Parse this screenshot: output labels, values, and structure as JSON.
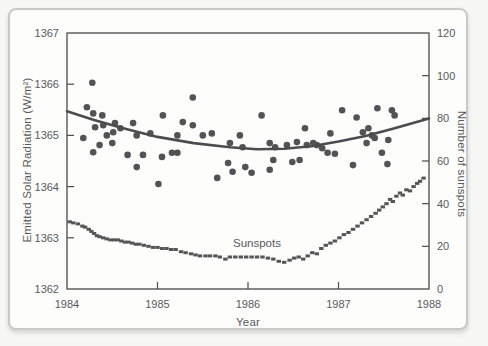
{
  "chart_data": {
    "type": "scatter",
    "title": "",
    "xlabel": "Year",
    "ylabel_left": "Emitted Solar Radiation (W/m²)",
    "ylabel_right": "Number of sunspots",
    "xlim": [
      1984,
      1988
    ],
    "ylim_left": [
      1362,
      1367
    ],
    "ylim_right": [
      0,
      120
    ],
    "x_ticks": [
      1984,
      1985,
      1986,
      1987,
      1988
    ],
    "y_left_ticks": [
      1362,
      1363,
      1364,
      1365,
      1366,
      1367
    ],
    "y_right_ticks": [
      0,
      20,
      40,
      60,
      80,
      100,
      120
    ],
    "grid": false,
    "legend": "none",
    "annotation": {
      "text": "Sunspots",
      "x": 1986.05,
      "y_right": 20
    },
    "style": {
      "axis_color": "#4b4b4b",
      "text_color": "#59595b",
      "point_color": "#535355",
      "curve_color": "#4c4c4e",
      "sunspot_color": "#565658",
      "card_border": "#c9c9c7",
      "card_bg": "#fdfdfc"
    },
    "series": [
      {
        "name": "emitted-solar-radiation",
        "type": "scatter",
        "marker": "circle",
        "axis": "left",
        "points": [
          [
            1984.18,
            1364.95
          ],
          [
            1984.22,
            1365.55
          ],
          [
            1984.28,
            1366.03
          ],
          [
            1984.29,
            1365.43
          ],
          [
            1984.29,
            1364.67
          ],
          [
            1984.31,
            1365.16
          ],
          [
            1984.36,
            1364.81
          ],
          [
            1984.39,
            1365.39
          ],
          [
            1984.4,
            1365.2
          ],
          [
            1984.44,
            1365.0
          ],
          [
            1984.5,
            1364.85
          ],
          [
            1984.51,
            1365.06
          ],
          [
            1984.53,
            1365.24
          ],
          [
            1984.59,
            1365.14
          ],
          [
            1984.67,
            1364.62
          ],
          [
            1984.73,
            1365.24
          ],
          [
            1984.77,
            1365.0
          ],
          [
            1984.77,
            1364.38
          ],
          [
            1984.84,
            1364.62
          ],
          [
            1984.92,
            1365.04
          ],
          [
            1985.01,
            1364.05
          ],
          [
            1985.05,
            1364.58
          ],
          [
            1985.06,
            1365.39
          ],
          [
            1985.16,
            1364.66
          ],
          [
            1985.22,
            1365.0
          ],
          [
            1985.22,
            1364.66
          ],
          [
            1985.28,
            1365.26
          ],
          [
            1985.39,
            1365.74
          ],
          [
            1985.39,
            1365.2
          ],
          [
            1985.5,
            1365.0
          ],
          [
            1985.6,
            1365.04
          ],
          [
            1985.66,
            1364.17
          ],
          [
            1985.78,
            1364.46
          ],
          [
            1985.8,
            1364.85
          ],
          [
            1985.83,
            1364.29
          ],
          [
            1985.91,
            1365.0
          ],
          [
            1985.94,
            1364.77
          ],
          [
            1985.97,
            1364.38
          ],
          [
            1986.04,
            1364.27
          ],
          [
            1986.15,
            1365.39
          ],
          [
            1986.24,
            1364.85
          ],
          [
            1986.24,
            1364.33
          ],
          [
            1986.28,
            1364.52
          ],
          [
            1986.3,
            1364.77
          ],
          [
            1986.43,
            1364.81
          ],
          [
            1986.49,
            1364.48
          ],
          [
            1986.54,
            1364.87
          ],
          [
            1986.57,
            1364.52
          ],
          [
            1986.63,
            1365.14
          ],
          [
            1986.65,
            1364.81
          ],
          [
            1986.72,
            1364.85
          ],
          [
            1986.76,
            1364.81
          ],
          [
            1986.82,
            1364.75
          ],
          [
            1986.88,
            1364.66
          ],
          [
            1986.91,
            1365.04
          ],
          [
            1986.96,
            1364.64
          ],
          [
            1987.04,
            1365.49
          ],
          [
            1987.16,
            1364.42
          ],
          [
            1987.2,
            1365.35
          ],
          [
            1987.27,
            1365.06
          ],
          [
            1987.31,
            1364.85
          ],
          [
            1987.33,
            1365.14
          ],
          [
            1987.37,
            1365.0
          ],
          [
            1987.4,
            1364.95
          ],
          [
            1987.43,
            1365.53
          ],
          [
            1987.48,
            1364.66
          ],
          [
            1987.54,
            1364.44
          ],
          [
            1987.55,
            1364.91
          ],
          [
            1987.59,
            1365.49
          ],
          [
            1987.62,
            1365.39
          ]
        ]
      },
      {
        "name": "radiation-trend-curve",
        "type": "line",
        "axis": "left",
        "points": [
          [
            1984.0,
            1365.47
          ],
          [
            1984.3,
            1365.3
          ],
          [
            1984.6,
            1365.15
          ],
          [
            1985.0,
            1364.97
          ],
          [
            1985.4,
            1364.85
          ],
          [
            1985.8,
            1364.77
          ],
          [
            1986.1,
            1364.73
          ],
          [
            1986.4,
            1364.74
          ],
          [
            1986.7,
            1364.79
          ],
          [
            1987.0,
            1364.88
          ],
          [
            1987.3,
            1364.99
          ],
          [
            1987.6,
            1365.13
          ],
          [
            1988.0,
            1365.33
          ]
        ]
      },
      {
        "name": "sunspots",
        "type": "scatter",
        "marker": "square",
        "axis": "right",
        "points": [
          [
            1984.03,
            31.5
          ],
          [
            1984.07,
            31
          ],
          [
            1984.12,
            30.5
          ],
          [
            1984.17,
            29.5
          ],
          [
            1984.2,
            29
          ],
          [
            1984.24,
            28
          ],
          [
            1984.27,
            27
          ],
          [
            1984.3,
            26
          ],
          [
            1984.33,
            25
          ],
          [
            1984.36,
            24.5
          ],
          [
            1984.4,
            24
          ],
          [
            1984.44,
            23.5
          ],
          [
            1984.48,
            23
          ],
          [
            1984.52,
            23
          ],
          [
            1984.56,
            23
          ],
          [
            1984.6,
            22.5
          ],
          [
            1984.64,
            22
          ],
          [
            1984.68,
            22
          ],
          [
            1984.72,
            21.5
          ],
          [
            1984.76,
            21
          ],
          [
            1984.8,
            21
          ],
          [
            1984.85,
            20.5
          ],
          [
            1984.9,
            20
          ],
          [
            1984.95,
            19.5
          ],
          [
            1985.0,
            19.5
          ],
          [
            1985.05,
            19
          ],
          [
            1985.1,
            19
          ],
          [
            1985.15,
            18.5
          ],
          [
            1985.2,
            18.5
          ],
          [
            1985.26,
            17.5
          ],
          [
            1985.31,
            17
          ],
          [
            1985.37,
            16.5
          ],
          [
            1985.42,
            16
          ],
          [
            1985.47,
            15.5
          ],
          [
            1985.53,
            15.5
          ],
          [
            1985.58,
            15.5
          ],
          [
            1985.64,
            15.5
          ],
          [
            1985.69,
            15
          ],
          [
            1985.75,
            14
          ],
          [
            1985.8,
            15
          ],
          [
            1985.86,
            15
          ],
          [
            1985.92,
            15
          ],
          [
            1985.98,
            15
          ],
          [
            1986.04,
            15
          ],
          [
            1986.1,
            15
          ],
          [
            1986.16,
            15
          ],
          [
            1986.22,
            14.5
          ],
          [
            1986.28,
            14
          ],
          [
            1986.34,
            13
          ],
          [
            1986.4,
            12.5
          ],
          [
            1986.46,
            13.5
          ],
          [
            1986.51,
            14.5
          ],
          [
            1986.56,
            15
          ],
          [
            1986.61,
            14
          ],
          [
            1986.66,
            15.5
          ],
          [
            1986.71,
            17
          ],
          [
            1986.76,
            16.5
          ],
          [
            1986.81,
            19
          ],
          [
            1986.86,
            20.5
          ],
          [
            1986.91,
            21.5
          ],
          [
            1986.96,
            22.5
          ],
          [
            1987.01,
            24
          ],
          [
            1987.06,
            25.5
          ],
          [
            1987.11,
            26.5
          ],
          [
            1987.16,
            28
          ],
          [
            1987.21,
            29.5
          ],
          [
            1987.26,
            31
          ],
          [
            1987.31,
            32.5
          ],
          [
            1987.36,
            34
          ],
          [
            1987.41,
            35.5
          ],
          [
            1987.45,
            37
          ],
          [
            1987.49,
            38.5
          ],
          [
            1987.53,
            40
          ],
          [
            1987.57,
            42
          ],
          [
            1987.6,
            41
          ],
          [
            1987.64,
            43.5
          ],
          [
            1987.68,
            45
          ],
          [
            1987.71,
            44
          ],
          [
            1987.75,
            46.5
          ],
          [
            1987.79,
            46
          ],
          [
            1987.83,
            48
          ],
          [
            1987.87,
            49.5
          ],
          [
            1987.9,
            50.5
          ],
          [
            1987.94,
            52
          ]
        ]
      }
    ]
  }
}
